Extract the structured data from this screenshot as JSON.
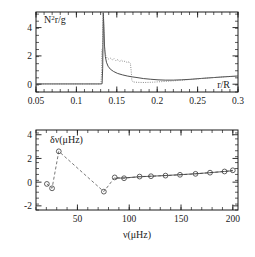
{
  "figure": {
    "background": "#ffffff",
    "ink": "#1a1a1a"
  },
  "chart_data": [
    {
      "type": "line",
      "panel": "top",
      "title": "",
      "xlabel": "r/R",
      "ylabel": "N²r/g",
      "xlim": [
        0.05,
        0.3
      ],
      "ylim": [
        -0.55,
        5.1
      ],
      "xticks": [
        0.05,
        0.1,
        0.15,
        0.2,
        0.25,
        0.3
      ],
      "xticklabels": [
        "0.05",
        "0.1",
        "0.15",
        "0.2",
        "0.25",
        "0.3"
      ],
      "yticks": [
        0,
        2,
        4
      ],
      "yticklabels": [
        "0",
        "2",
        "4"
      ],
      "xminor_step": 0.01,
      "yminor_step": 0.5,
      "grid": false,
      "legend": "none",
      "series": [
        {
          "name": "solid-model",
          "style": "solid",
          "color": "#3a3a3a",
          "points": [
            [
              0.05,
              0.02
            ],
            [
              0.07,
              0.02
            ],
            [
              0.09,
              0.02
            ],
            [
              0.11,
              0.02
            ],
            [
              0.125,
              0.02
            ],
            [
              0.13,
              0.02
            ],
            [
              0.1318,
              0.03
            ],
            [
              0.1325,
              1.1
            ],
            [
              0.133,
              3.2
            ],
            [
              0.1333,
              5.05
            ],
            [
              0.134,
              4.1
            ],
            [
              0.1348,
              2.7
            ],
            [
              0.1358,
              1.95
            ],
            [
              0.1372,
              1.55
            ],
            [
              0.1392,
              1.27
            ],
            [
              0.142,
              1.06
            ],
            [
              0.146,
              0.9
            ],
            [
              0.151,
              0.76
            ],
            [
              0.157,
              0.66
            ],
            [
              0.163,
              0.58
            ],
            [
              0.169,
              0.52
            ],
            [
              0.175,
              0.47
            ],
            [
              0.183,
              0.4
            ],
            [
              0.192,
              0.35
            ],
            [
              0.201,
              0.31
            ],
            [
              0.21,
              0.29
            ],
            [
              0.22,
              0.29
            ],
            [
              0.23,
              0.31
            ],
            [
              0.242,
              0.35
            ],
            [
              0.255,
              0.41
            ],
            [
              0.27,
              0.47
            ],
            [
              0.285,
              0.53
            ],
            [
              0.3,
              0.58
            ]
          ]
        },
        {
          "name": "dotted-model",
          "style": "dotted",
          "color": "#707070",
          "points": [
            [
              0.05,
              0.02
            ],
            [
              0.08,
              0.02
            ],
            [
              0.11,
              0.02
            ],
            [
              0.128,
              0.02
            ],
            [
              0.1305,
              0.04
            ],
            [
              0.1312,
              0.9
            ],
            [
              0.1318,
              2.45
            ],
            [
              0.1322,
              1.6
            ],
            [
              0.1326,
              4.2
            ],
            [
              0.1332,
              5.05
            ],
            [
              0.134,
              3.6
            ],
            [
              0.135,
              2.4
            ],
            [
              0.1362,
              2.05
            ],
            [
              0.1378,
              1.86
            ],
            [
              0.1398,
              1.78
            ],
            [
              0.142,
              1.84
            ],
            [
              0.1442,
              1.72
            ],
            [
              0.1468,
              1.8
            ],
            [
              0.149,
              1.66
            ],
            [
              0.1512,
              1.74
            ],
            [
              0.1535,
              1.6
            ],
            [
              0.1558,
              1.7
            ],
            [
              0.158,
              1.58
            ],
            [
              0.1605,
              1.64
            ],
            [
              0.1628,
              1.52
            ],
            [
              0.165,
              1.58
            ],
            [
              0.1668,
              1.47
            ],
            [
              0.1678,
              0.95
            ],
            [
              0.1686,
              0.28
            ],
            [
              0.17,
              0.16
            ],
            [
              0.176,
              0.13
            ],
            [
              0.184,
              0.12
            ],
            [
              0.194,
              0.14
            ],
            [
              0.205,
              0.18
            ],
            [
              0.218,
              0.23
            ],
            [
              0.232,
              0.29
            ],
            [
              0.248,
              0.37
            ],
            [
              0.265,
              0.45
            ],
            [
              0.283,
              0.52
            ],
            [
              0.3,
              0.57
            ]
          ]
        }
      ]
    },
    {
      "type": "scatter",
      "panel": "bottom",
      "title": "",
      "xlabel": "ν(μHz)",
      "ylabel": "δν(μHz)",
      "xlim": [
        10,
        205
      ],
      "ylim": [
        -2.35,
        4.4
      ],
      "xticks": [
        50,
        100,
        150,
        200
      ],
      "xticklabels": [
        "50",
        "100",
        "150",
        "200"
      ],
      "yticks": [
        -2,
        0,
        2,
        4
      ],
      "yticklabels": [
        "-2",
        "0",
        "2",
        "4"
      ],
      "xminor_step": 10,
      "yminor_step": 0.5,
      "grid": false,
      "legend": "none",
      "marker": "open-circle",
      "series": [
        {
          "name": "observed-dashed",
          "style": "dashed",
          "color": "#555555",
          "points": [
            [
              20.5,
              -0.15
            ],
            [
              25.5,
              -0.52
            ],
            [
              32.0,
              2.6
            ],
            [
              75.5,
              -0.8
            ],
            [
              86.0,
              0.4
            ],
            [
              95.0,
              0.33
            ],
            [
              110.0,
              0.47
            ],
            [
              121.0,
              0.5
            ],
            [
              135.0,
              0.55
            ],
            [
              149.0,
              0.62
            ],
            [
              164.0,
              0.7
            ],
            [
              178.0,
              0.8
            ],
            [
              192.0,
              0.9
            ],
            [
              200.0,
              1.0
            ]
          ]
        },
        {
          "name": "model-solid",
          "style": "solid",
          "color": "#3a3a3a",
          "points": [
            [
              86.0,
              0.32
            ],
            [
              95.0,
              0.36
            ],
            [
              110.0,
              0.45
            ],
            [
              121.0,
              0.5
            ],
            [
              135.0,
              0.56
            ],
            [
              149.0,
              0.63
            ],
            [
              164.0,
              0.71
            ],
            [
              178.0,
              0.8
            ],
            [
              192.0,
              0.9
            ],
            [
              200.0,
              0.96
            ]
          ]
        }
      ]
    }
  ]
}
